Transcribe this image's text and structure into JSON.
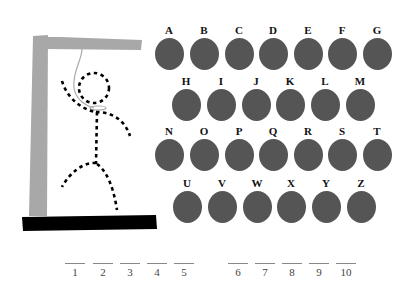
{
  "gallows": {
    "post_color": "#a8a8a8",
    "base_color": "#000000",
    "rope_color": "#aaaaaa",
    "figure_color": "#000000"
  },
  "keyboard": {
    "disc_color": "#555555",
    "rows": [
      [
        "A",
        "B",
        "C",
        "D",
        "E",
        "F",
        "G"
      ],
      [
        "H",
        "I",
        "J",
        "K",
        "L",
        "M"
      ],
      [
        "N",
        "O",
        "P",
        "Q",
        "R",
        "S",
        "T"
      ],
      [
        "U",
        "V",
        "W",
        "X",
        "Y",
        "Z"
      ]
    ]
  },
  "word_blanks": {
    "group1": [
      "1",
      "2",
      "3",
      "4",
      "5"
    ],
    "group2": [
      "6",
      "7",
      "8",
      "9",
      "10"
    ]
  }
}
